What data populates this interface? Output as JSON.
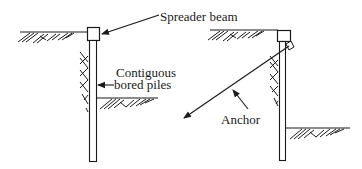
{
  "diagram": {
    "type": "engineering-cross-section",
    "colors": {
      "ink": "#1a1a1a",
      "background": "#ffffff"
    },
    "labels": {
      "spreader_beam": "Spreader beam",
      "contiguous_line1": "Contiguous",
      "contiguous_line2": "bored piles",
      "anchor": "Anchor"
    },
    "left_wall": {
      "description": "Contiguous bored pile wall propped by spreader beam",
      "components": [
        "ground-surface",
        "spreader-beam",
        "contiguous-bored-pile",
        "excavation-base"
      ]
    },
    "right_wall": {
      "description": "Contiguous bored pile wall with inclined ground anchor",
      "components": [
        "ground-surface",
        "capping-beam",
        "contiguous-bored-pile",
        "ground-anchor",
        "excavation-base"
      ]
    }
  }
}
